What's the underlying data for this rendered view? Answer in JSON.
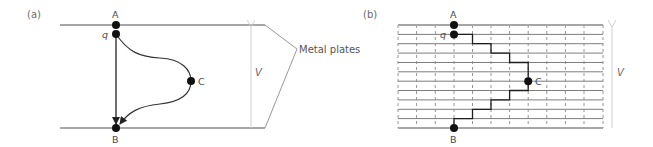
{
  "figure": {
    "panel_a": {
      "label": "(a)",
      "points": {
        "A": "A",
        "q": "q",
        "C": "C",
        "B": "B"
      },
      "voltage_label": "V",
      "annotation": "Metal plates",
      "paths": [
        "straight q to B",
        "curved q via C to B"
      ]
    },
    "panel_b": {
      "label": "(b)",
      "points": {
        "A": "A",
        "q": "q",
        "C": "C",
        "B": "B"
      },
      "voltage_label": "V",
      "grid": {
        "horizontal_equipotentials": 10,
        "vertical_dashed_lines": 10
      },
      "path": "staircase q via C to B"
    }
  },
  "colors": {
    "plate": "#a6a6a6",
    "path": "#222222",
    "grid_solid": "#6e6e6e",
    "grid_dashed": "#8a8a8a",
    "v_arrow": "#cfcfcf",
    "leader": "#8c8c8c"
  }
}
